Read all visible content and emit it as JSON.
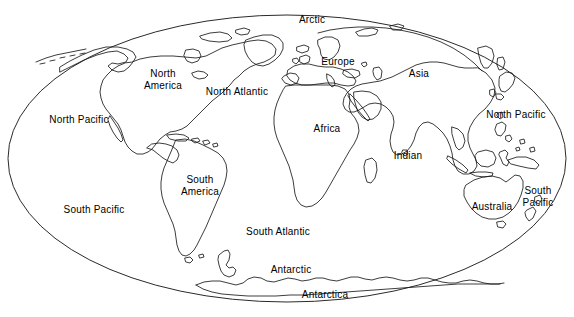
{
  "figure": {
    "projection": "elliptical (Mollweide-style) world projection",
    "background_color": "#ffffff",
    "outline_color": "#1a1a1a",
    "frame_color": "#2a2a2a",
    "width": 574,
    "height": 317
  },
  "frame": {
    "shape": "ellipse",
    "center_x": 287,
    "center_y": 158.5,
    "radius_x": 279,
    "radius_y": 143.5
  },
  "labels": [
    {
      "id": "arctic",
      "text": "Arctic",
      "kind": "ocean",
      "x": 312,
      "y": 20
    },
    {
      "id": "europe",
      "text": "Europe",
      "kind": "continent",
      "x": 338,
      "y": 62
    },
    {
      "id": "asia",
      "text": "Asia",
      "kind": "continent",
      "x": 419,
      "y": 74
    },
    {
      "id": "north-america",
      "text": "North\nAmerica",
      "kind": "continent",
      "x": 163,
      "y": 80
    },
    {
      "id": "north-atlantic",
      "text": "North Atlantic",
      "kind": "ocean",
      "x": 237,
      "y": 92
    },
    {
      "id": "north-pacific-west",
      "text": "North Pacific",
      "kind": "ocean",
      "x": 79,
      "y": 120
    },
    {
      "id": "north-pacific-east",
      "text": "North Pacific",
      "kind": "ocean",
      "x": 516,
      "y": 115
    },
    {
      "id": "africa",
      "text": "Africa",
      "kind": "continent",
      "x": 327,
      "y": 129
    },
    {
      "id": "indian",
      "text": "Indian",
      "kind": "ocean",
      "x": 408,
      "y": 156
    },
    {
      "id": "south-america",
      "text": "South\nAmerica",
      "kind": "continent",
      "x": 200,
      "y": 186
    },
    {
      "id": "south-pacific-east",
      "text": "South\nPacific",
      "kind": "ocean",
      "x": 538,
      "y": 197
    },
    {
      "id": "australia",
      "text": "Australia",
      "kind": "continent",
      "x": 492,
      "y": 207
    },
    {
      "id": "south-pacific-west",
      "text": "South Pacific",
      "kind": "ocean",
      "x": 94,
      "y": 210
    },
    {
      "id": "south-atlantic",
      "text": "South Atlantic",
      "kind": "ocean",
      "x": 278,
      "y": 232
    },
    {
      "id": "antarctic",
      "text": "Antarctic",
      "kind": "ocean",
      "x": 291,
      "y": 270
    },
    {
      "id": "antarctica",
      "text": "Antarctica",
      "kind": "continent",
      "x": 325,
      "y": 295
    }
  ]
}
